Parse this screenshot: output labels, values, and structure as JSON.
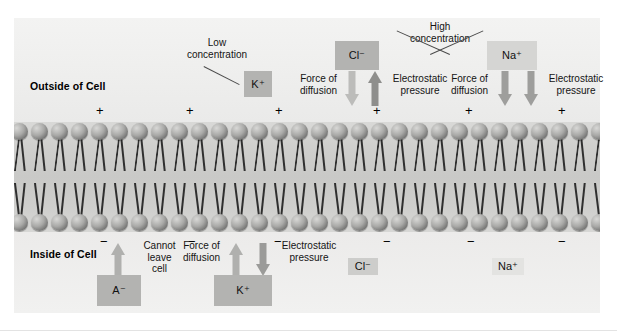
{
  "figure": {
    "title_outside": "Outside of Cell",
    "title_inside": "Inside of Cell"
  },
  "labels": {
    "low_concentration": "Low\nconcentration",
    "high_concentration": "High\nconcentration",
    "force_of_diffusion": "Force of\ndiffusion",
    "electrostatic_pressure": "Electrostatic\npressure",
    "cannot_leave_cell": "Cannot\nleave\ncell"
  },
  "ions": {
    "k_outside": "K⁺",
    "cl_outside": "Cl⁻",
    "na_outside": "Na⁺",
    "a_inside": "A⁻",
    "k_inside": "K⁺",
    "cl_inside": "Cl⁻",
    "na_inside": "Na⁺"
  },
  "charges": {
    "positive": "+",
    "negative": "−",
    "outside_count": 6,
    "inside_count": 6
  },
  "colors": {
    "ion_box_dark": "#b3b3b1",
    "ion_box_pale": "#d5d5d3",
    "arrow_light": "#b6b6b4",
    "arrow_dark": "#8e8e8c",
    "background": "#eeeeed",
    "membrane": "#c9c9c7",
    "text": "#141414"
  },
  "annotations": {
    "outside_forces": [
      {
        "ion": "Cl⁻",
        "force": "Force of\ndiffusion",
        "direction": "down"
      },
      {
        "ion": "Cl⁻",
        "force": "Electrostatic\npressure",
        "direction": "up"
      },
      {
        "ion": "Na⁺",
        "force": "Force of\ndiffusion",
        "direction": "down"
      },
      {
        "ion": "Na⁺",
        "force": "Electrostatic\npressure",
        "direction": "down"
      }
    ],
    "inside_forces": [
      {
        "ion": "A⁻",
        "force": "Cannot\nleave\ncell",
        "direction": "up"
      },
      {
        "ion": "K⁺",
        "force": "Force of\ndiffusion",
        "direction": "up"
      },
      {
        "ion": "K⁺",
        "force": "Electrostatic\npressure",
        "direction": "down"
      }
    ]
  }
}
